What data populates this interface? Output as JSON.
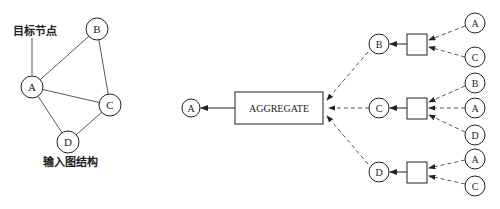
{
  "input_graph": {
    "target_label": "目标节点",
    "caption": "输入图结构",
    "nodes": {
      "A": "A",
      "B": "B",
      "C": "C",
      "D": "D"
    }
  },
  "aggregation": {
    "output_node": "A",
    "aggregate_label": "AGGREGATE",
    "level1": [
      {
        "node": "B",
        "neighbors": [
          "A",
          "C"
        ]
      },
      {
        "node": "C",
        "neighbors": [
          "B",
          "A",
          "D"
        ]
      },
      {
        "node": "D",
        "neighbors": [
          "A",
          "C"
        ]
      }
    ]
  }
}
